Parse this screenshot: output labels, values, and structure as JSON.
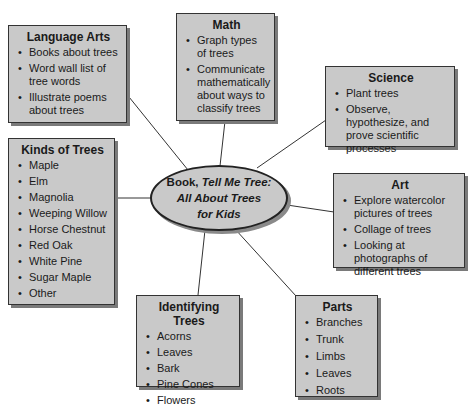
{
  "center": {
    "prefix": "Book, ",
    "title_line1": "Tell Me Tree:",
    "title_line2": "All About Trees",
    "title_line3": "for Kids"
  },
  "nodes": {
    "language_arts": {
      "title": "Language Arts",
      "items": [
        "Books about trees",
        "Word wall list of tree words",
        "Illustrate poems about trees"
      ]
    },
    "math": {
      "title": "Math",
      "items": [
        "Graph types of trees",
        "Communicate mathematically about ways to classify trees"
      ]
    },
    "science": {
      "title": "Science",
      "items": [
        "Plant trees",
        "Observe, hypothesize, and prove scientific processes"
      ]
    },
    "kinds": {
      "title": "Kinds of Trees",
      "items": [
        "Maple",
        "Elm",
        "Magnolia",
        "Weeping Willow",
        "Horse Chestnut",
        "Red Oak",
        "White Pine",
        "Sugar Maple",
        "Other"
      ]
    },
    "art": {
      "title": "Art",
      "items": [
        "Explore watercolor pictures of trees",
        "Collage of trees",
        "Looking at photographs of different trees"
      ]
    },
    "identifying": {
      "title": "Identifying Trees",
      "items": [
        "Acorns",
        "Leaves",
        "Bark",
        "Pine Cones",
        "Flowers"
      ]
    },
    "parts": {
      "title": "Parts",
      "items": [
        "Branches",
        "Trunk",
        "Limbs",
        "Leaves",
        "Roots"
      ]
    }
  }
}
